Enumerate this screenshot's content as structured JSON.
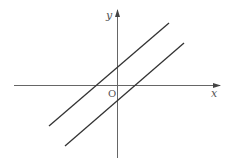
{
  "diagram": {
    "type": "coordinate-plane",
    "axes": {
      "x_label": "x",
      "y_label": "y",
      "origin_label": "O"
    },
    "lines": [
      {
        "name": "upper-line",
        "description": "line with positive slope, y-intercept above origin, x-intercept left of origin"
      },
      {
        "name": "lower-line",
        "description": "parallel line with positive slope, y-intercept below origin, x-intercept right of origin"
      }
    ],
    "colors": {
      "axis": "#666666",
      "line": "#333333",
      "text": "#555555"
    }
  }
}
